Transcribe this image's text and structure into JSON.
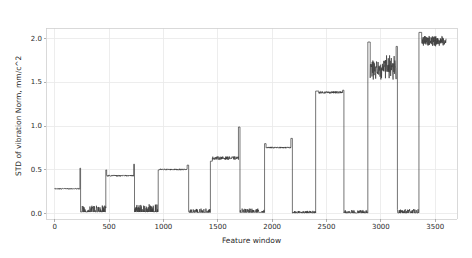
{
  "chart_data": {
    "type": "line",
    "title": "",
    "xlabel": "Feature window",
    "ylabel": "STD of vibration Norm, mm/c^2",
    "xlim": [
      -80,
      3700
    ],
    "ylim": [
      -0.06,
      2.12
    ],
    "xticks": [
      0,
      500,
      1000,
      1500,
      2000,
      2500,
      3000,
      3500
    ],
    "xtick_labels": [
      "0",
      "500",
      "1000",
      "1500",
      "2000",
      "2500",
      "3000",
      "3500"
    ],
    "yticks": [
      0.0,
      0.5,
      1.0,
      1.5,
      2.0
    ],
    "ytick_labels": [
      "0.0",
      "0.5",
      "1.0",
      "1.5",
      "2.0"
    ],
    "grid": true,
    "grid_color": "#e8e8e8",
    "line_color": "#3a3a3a",
    "line_width": 0.7,
    "legend": null,
    "series": [
      {
        "name": "STD of vibration Norm",
        "description": "Step/square-wave signal: plateaus of increasing amplitude separated by near-zero baseline runs",
        "segments": [
          {
            "x_start": 0,
            "x_end": 232,
            "level": 0.285,
            "noise": 0.006,
            "kind": "plateau"
          },
          {
            "x_start": 232,
            "x_end": 238,
            "level": 0.52,
            "noise": 0.0,
            "kind": "spike"
          },
          {
            "x_start": 238,
            "x_end": 470,
            "level": 0.02,
            "noise": 0.035,
            "kind": "baseline"
          },
          {
            "x_start": 470,
            "x_end": 478,
            "level": 0.5,
            "noise": 0.0,
            "kind": "rise"
          },
          {
            "x_start": 478,
            "x_end": 726,
            "level": 0.435,
            "noise": 0.008,
            "kind": "plateau"
          },
          {
            "x_start": 726,
            "x_end": 734,
            "level": 0.565,
            "noise": 0.0,
            "kind": "spike"
          },
          {
            "x_start": 734,
            "x_end": 952,
            "level": 0.02,
            "noise": 0.04,
            "kind": "baseline"
          },
          {
            "x_start": 952,
            "x_end": 962,
            "level": 0.5,
            "noise": 0.0,
            "kind": "rise"
          },
          {
            "x_start": 962,
            "x_end": 1218,
            "level": 0.505,
            "noise": 0.008,
            "kind": "plateau"
          },
          {
            "x_start": 1218,
            "x_end": 1232,
            "level": 0.555,
            "noise": 0.0,
            "kind": "spike"
          },
          {
            "x_start": 1232,
            "x_end": 1432,
            "level": 0.015,
            "noise": 0.02,
            "kind": "baseline"
          },
          {
            "x_start": 1432,
            "x_end": 1450,
            "level": 0.6,
            "noise": 0.0,
            "kind": "rise"
          },
          {
            "x_start": 1450,
            "x_end": 1690,
            "level": 0.635,
            "noise": 0.018,
            "kind": "plateau"
          },
          {
            "x_start": 1690,
            "x_end": 1704,
            "level": 0.99,
            "noise": 0.0,
            "kind": "spike"
          },
          {
            "x_start": 1704,
            "x_end": 1930,
            "level": 0.015,
            "noise": 0.02,
            "kind": "baseline"
          },
          {
            "x_start": 1930,
            "x_end": 1944,
            "level": 0.8,
            "noise": 0.0,
            "kind": "rise"
          },
          {
            "x_start": 1944,
            "x_end": 2172,
            "level": 0.755,
            "noise": 0.008,
            "kind": "plateau"
          },
          {
            "x_start": 2172,
            "x_end": 2186,
            "level": 0.86,
            "noise": 0.0,
            "kind": "spike"
          },
          {
            "x_start": 2186,
            "x_end": 2400,
            "level": 0.008,
            "noise": 0.012,
            "kind": "baseline"
          },
          {
            "x_start": 2400,
            "x_end": 2430,
            "level": 1.4,
            "noise": 0.0,
            "kind": "rise"
          },
          {
            "x_start": 2430,
            "x_end": 2648,
            "level": 1.385,
            "noise": 0.012,
            "kind": "plateau"
          },
          {
            "x_start": 2648,
            "x_end": 2660,
            "level": 1.41,
            "noise": 0.0,
            "kind": "spike"
          },
          {
            "x_start": 2660,
            "x_end": 2880,
            "level": 0.008,
            "noise": 0.015,
            "kind": "baseline"
          },
          {
            "x_start": 2880,
            "x_end": 2902,
            "level": 1.96,
            "noise": 0.0,
            "kind": "rise"
          },
          {
            "x_start": 2902,
            "x_end": 3140,
            "level": 1.67,
            "noise": 0.1,
            "kind": "noisy-plateau"
          },
          {
            "x_start": 3140,
            "x_end": 3152,
            "level": 1.91,
            "noise": 0.0,
            "kind": "spike"
          },
          {
            "x_start": 3152,
            "x_end": 3350,
            "level": 0.008,
            "noise": 0.02,
            "kind": "baseline"
          },
          {
            "x_start": 3350,
            "x_end": 3375,
            "level": 2.07,
            "noise": 0.0,
            "kind": "rise"
          },
          {
            "x_start": 3375,
            "x_end": 3600,
            "level": 1.975,
            "noise": 0.045,
            "kind": "noisy-plateau"
          }
        ],
        "plateau_levels": [
          0.285,
          0.435,
          0.505,
          0.635,
          0.755,
          1.385,
          1.67,
          1.975
        ],
        "baseline_level": 0.01,
        "peak_value": 2.07,
        "min_value": 0.0,
        "n_points": 3600
      }
    ]
  }
}
